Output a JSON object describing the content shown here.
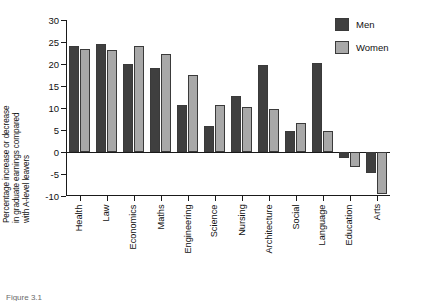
{
  "chart_data": {
    "type": "bar",
    "title": "",
    "subtitle": "",
    "xlabel": "",
    "ylabel": "Percentage increase or decrease in graduate earnings compared with A-level leavers",
    "ylabel_lines": [
      "Percentage increase or decrease",
      "in graduate earnings compared",
      "with A-level leavers"
    ],
    "categories": [
      "Health",
      "Law",
      "Economics",
      "Maths",
      "Engineering",
      "Science",
      "Nursing",
      "Architecture",
      "Social",
      "Language",
      "Education",
      "Arts"
    ],
    "series": [
      {
        "name": "Men",
        "color": "#3f3f3f",
        "values": [
          24,
          24.5,
          20,
          19,
          10.7,
          6,
          12.8,
          19.8,
          4.7,
          20.3,
          -1.3,
          -4.7
        ]
      },
      {
        "name": "Women",
        "color": "#a8a8a8",
        "values": [
          23.5,
          23.2,
          24.2,
          22.3,
          17.6,
          10.7,
          10.3,
          9.7,
          6.5,
          4.7,
          -3.3,
          -9.5
        ]
      }
    ],
    "ylim": [
      -10,
      30
    ],
    "yticks": [
      30,
      25,
      20,
      15,
      10,
      5,
      0,
      -5,
      -10
    ],
    "ytick_labels": [
      "30",
      "25",
      "20",
      "15",
      "10",
      "5",
      "0",
      "-5",
      "-10"
    ],
    "grid": false,
    "legend_position": "top-right",
    "legend_entries": [
      "Men",
      "Women"
    ]
  },
  "caption": {
    "text": "Figure 3.1"
  }
}
